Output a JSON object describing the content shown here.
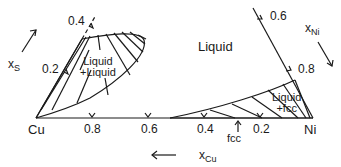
{
  "diagram": {
    "type": "ternary phase diagram section (Cu-Ni-S)",
    "vertices": {
      "left": "Cu",
      "right": "Ni"
    },
    "regions": {
      "liquid": "Liquid",
      "liquid_liquid_line1": "Liquid",
      "liquid_liquid_line2": "+Liquid",
      "liquid_fcc_line1": "Liquid",
      "liquid_fcc_line2": "+fcc"
    },
    "axes": {
      "xS": {
        "symbol": "x",
        "subscript": "S",
        "ticks": [
          "0.2",
          "0.4"
        ]
      },
      "xNi": {
        "symbol": "x",
        "subscript": "Ni",
        "ticks": [
          "0.6",
          "0.8"
        ]
      },
      "xCu": {
        "symbol": "x",
        "subscript": "Cu",
        "ticks": [
          "0.8",
          "0.6",
          "0.4",
          "0.2"
        ]
      }
    },
    "annotations": {
      "fcc_arrow_label": "fcc"
    },
    "colors": {
      "ink": "#1a1a1a",
      "background": "#ffffff"
    }
  }
}
